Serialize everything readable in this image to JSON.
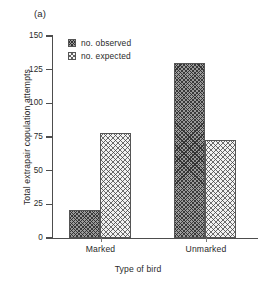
{
  "panel": {
    "label": "(a)"
  },
  "chart_data": {
    "type": "bar",
    "title": "",
    "subtitle": "",
    "panel_label": "(a)",
    "categories": [
      "Marked",
      "Unmarked"
    ],
    "series": [
      {
        "name": "no. observed",
        "values": [
          21,
          130
        ]
      },
      {
        "name": "no. expected",
        "values": [
          78,
          73
        ]
      }
    ],
    "xlabel": "Type of bird",
    "ylabel": "Total extrapair copulation attempts",
    "ylim": [
      0,
      150
    ],
    "yticks": [
      0,
      25,
      50,
      75,
      100,
      125,
      150
    ],
    "ytick_labels": [
      "0",
      "25",
      "50",
      "75",
      "100",
      "125",
      "150"
    ],
    "xtick_labels": [
      "Marked",
      "Unmarked"
    ],
    "grid": false,
    "legend_position": "top-left-inside",
    "legend_entries": [
      "no. observed",
      "no. expected"
    ],
    "bar_style": {
      "observed_fill": "#9a9a9a",
      "observed_pattern": "dense-diagonal-crosshatch",
      "expected_fill": "#f2f2f2",
      "expected_pattern": "light-diagonal-crosshatch",
      "edge_color": "#555555"
    },
    "axis_color": "#4d4d4d"
  },
  "axes": {
    "ylabel": "Total extrapair copulation attempts",
    "xlabel": "Type of bird",
    "yticks": [
      {
        "value": 150,
        "label": "150"
      },
      {
        "value": 125,
        "label": "125"
      },
      {
        "value": 100,
        "label": "100"
      },
      {
        "value": 75,
        "label": "75"
      },
      {
        "value": 50,
        "label": "50"
      },
      {
        "value": 25,
        "label": "25"
      },
      {
        "value": 0,
        "label": "0"
      }
    ],
    "xticks": [
      {
        "label": "Marked"
      },
      {
        "label": "Unmarked"
      }
    ]
  },
  "legend": {
    "items": [
      {
        "label": "no. observed",
        "pattern": "observed"
      },
      {
        "label": "no. expected",
        "pattern": "expected"
      }
    ]
  },
  "bars": [
    {
      "group": "Marked",
      "series": "no. observed",
      "value": 21,
      "pattern": "observed"
    },
    {
      "group": "Marked",
      "series": "no. expected",
      "value": 78,
      "pattern": "expected"
    },
    {
      "group": "Unmarked",
      "series": "no. observed",
      "value": 130,
      "pattern": "observed"
    },
    {
      "group": "Unmarked",
      "series": "no. expected",
      "value": 73,
      "pattern": "expected"
    }
  ]
}
